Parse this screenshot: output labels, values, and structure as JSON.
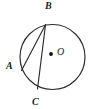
{
  "figure": {
    "kind": "circle-geometry-diagram",
    "background_color": "#ffffff",
    "stroke_color": "#2b2b2b",
    "label_color": "#1c1c1c",
    "canvas": {
      "width": 96,
      "height": 109
    },
    "circle": {
      "center_label": "O",
      "center_x": 52.5,
      "center_y": 57,
      "radius": 32.5
    },
    "center_dot": {
      "name": "center-point-O",
      "x": 51,
      "y": 54,
      "radius": 1.9
    },
    "points": [
      {
        "id": "B",
        "label": "B",
        "x": 45.5,
        "y": 24.8,
        "label_x": 45,
        "label_y": 1
      },
      {
        "id": "A",
        "label": "A",
        "x": 21.5,
        "y": 70.5,
        "label_x": 6,
        "label_y": 61
      },
      {
        "id": "C",
        "label": "C",
        "x": 37.5,
        "y": 89.0,
        "label_x": 32,
        "label_y": 97
      }
    ],
    "chords": [
      {
        "id": "BA",
        "from": "B",
        "to": "A",
        "x1": 45.5,
        "y1": 24.8,
        "x2": 21.5,
        "y2": 70.5
      },
      {
        "id": "BC",
        "from": "B",
        "to": "C",
        "x1": 45.5,
        "y1": 24.8,
        "x2": 37.5,
        "y2": 89.0
      }
    ],
    "labels": {
      "B": "B",
      "A": "A",
      "C": "C",
      "O": "O"
    }
  }
}
